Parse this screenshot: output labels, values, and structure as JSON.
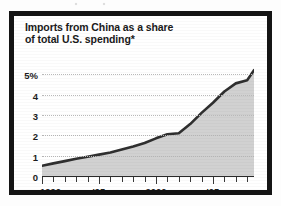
{
  "clipping": {
    "frame_color": "#141414",
    "paper_color": "#ffffff"
  },
  "chart_title": {
    "line1": "Imports from China as a share",
    "line2": "of total U.S. spending*"
  },
  "chart_data": {
    "type": "area",
    "title": "Imports from China as a share of total U.S. spending*",
    "xlabel": "",
    "ylabel": "",
    "xlim": [
      1990,
      2008.6
    ],
    "ylim": [
      0,
      5.6
    ],
    "grid": true,
    "legend": "none",
    "line_color": "#2f2f2f",
    "fill_color": "#c9c9c9",
    "grid_color": "#b9b9b9",
    "y_ticks": [
      {
        "value": 5,
        "label": "5%"
      },
      {
        "value": 4,
        "label": "4"
      },
      {
        "value": 3,
        "label": "3"
      },
      {
        "value": 2,
        "label": "2"
      },
      {
        "value": 1,
        "label": "1"
      },
      {
        "value": 0,
        "label": "0"
      }
    ],
    "x_ticks": [
      {
        "value": 1990,
        "label": "1990",
        "major": true
      },
      {
        "value": 1991,
        "label": "",
        "major": false
      },
      {
        "value": 1992,
        "label": "",
        "major": false
      },
      {
        "value": 1993,
        "label": "",
        "major": false
      },
      {
        "value": 1994,
        "label": "",
        "major": false
      },
      {
        "value": 1995,
        "label": "'95",
        "major": true
      },
      {
        "value": 1996,
        "label": "",
        "major": false
      },
      {
        "value": 1997,
        "label": "",
        "major": false
      },
      {
        "value": 1998,
        "label": "",
        "major": false
      },
      {
        "value": 1999,
        "label": "",
        "major": false
      },
      {
        "value": 2000,
        "label": "2000",
        "major": true
      },
      {
        "value": 2001,
        "label": "",
        "major": false
      },
      {
        "value": 2002,
        "label": "",
        "major": false
      },
      {
        "value": 2003,
        "label": "",
        "major": false
      },
      {
        "value": 2004,
        "label": "",
        "major": false
      },
      {
        "value": 2005,
        "label": "'05",
        "major": true
      },
      {
        "value": 2006,
        "label": "",
        "major": false
      },
      {
        "value": 2007,
        "label": "",
        "major": false
      },
      {
        "value": 2008,
        "label": "",
        "major": false
      }
    ],
    "x": [
      1990,
      1991,
      1992,
      1993,
      1994,
      1995,
      1996,
      1997,
      1998,
      1999,
      2000,
      2001,
      2002,
      2003,
      2004,
      2005,
      2006,
      2007,
      2008,
      2008.6
    ],
    "values": [
      0.5,
      0.62,
      0.73,
      0.85,
      0.95,
      1.05,
      1.15,
      1.3,
      1.45,
      1.62,
      1.85,
      2.05,
      2.1,
      2.55,
      3.1,
      3.6,
      4.15,
      4.55,
      4.7,
      5.2
    ],
    "series": [
      {
        "name": "Imports from China as a share of total U.S. spending",
        "units": "percent",
        "values": [
          0.5,
          0.62,
          0.73,
          0.85,
          0.95,
          1.05,
          1.15,
          1.3,
          1.45,
          1.62,
          1.85,
          2.05,
          2.1,
          2.55,
          3.1,
          3.6,
          4.15,
          4.55,
          4.7,
          5.2
        ]
      }
    ],
    "annotations": [
      {
        "text": "*",
        "meaning": "footnote marker attached to title"
      }
    ]
  }
}
